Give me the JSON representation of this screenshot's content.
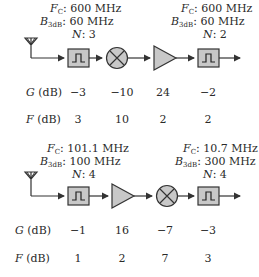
{
  "chains": [
    {
      "annotations": [
        {
          "fc_label": "F",
          "fc_sub": "C",
          "fc_value": ": 600 MHz",
          "b_label": "B",
          "b_sub": "3dB",
          "b_value": ": 60 MHz",
          "n_label": "N",
          "n_value": ": 3"
        },
        {
          "fc_label": "F",
          "fc_sub": "C",
          "fc_value": ": 600 MHz",
          "b_label": "B",
          "b_sub": "3dB",
          "b_value": ": 60 MHz",
          "n_label": "N",
          "n_value": ": 2"
        }
      ],
      "components": [
        "antenna",
        "bandpass-filter",
        "mixer",
        "amplifier",
        "bandpass-filter"
      ],
      "gain_row": {
        "label_var": "G",
        "label_unit": " (dB)",
        "values": [
          "−3",
          "−10",
          "24",
          "−2"
        ]
      },
      "nf_row": {
        "label_var": "F",
        "label_unit": " (dB)",
        "values": [
          "3",
          "10",
          "2",
          "2"
        ]
      }
    },
    {
      "annotations": [
        {
          "fc_label": "F",
          "fc_sub": "C",
          "fc_value": ": 101.1 MHz",
          "b_label": "B",
          "b_sub": "3dB",
          "b_value": ": 100 MHz",
          "n_label": "N",
          "n_value": ": 4"
        },
        {
          "fc_label": "F",
          "fc_sub": "C",
          "fc_value": ": 10.7 MHz",
          "b_label": "B",
          "b_sub": "3dB",
          "b_value": ": 300 MHz",
          "n_label": "N",
          "n_value": ": 4"
        }
      ],
      "components": [
        "antenna",
        "bandpass-filter",
        "amplifier",
        "mixer",
        "bandpass-filter"
      ],
      "gain_row": {
        "label_var": "G",
        "label_unit": " (dB)",
        "values": [
          "−1",
          "16",
          "−7",
          "−3"
        ]
      },
      "nf_row": {
        "label_var": "F",
        "label_unit": " (dB)",
        "values": [
          "1",
          "2",
          "7",
          "3"
        ]
      }
    }
  ],
  "colors": {
    "component_fill": "#c8c8c8",
    "stroke": "#333333"
  }
}
